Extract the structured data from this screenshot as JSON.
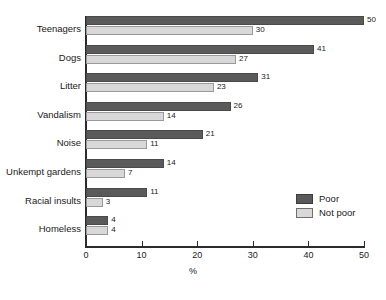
{
  "chart_data": {
    "type": "bar",
    "orientation": "horizontal",
    "title": "",
    "xlabel": "%",
    "ylabel": "",
    "xlim": [
      0,
      50
    ],
    "xticks": [
      0,
      10,
      20,
      30,
      40,
      50
    ],
    "xticklabels": [
      "0",
      "10",
      "20",
      "30",
      "40",
      "50"
    ],
    "grid": false,
    "legend_position": "lower-right",
    "categories": [
      "Teenagers",
      "Dogs",
      "Litter",
      "Vandalism",
      "Noise",
      "Unkempt gardens",
      "Racial insults",
      "Homeless"
    ],
    "series": [
      {
        "name": "Poor",
        "color": "#5a5a5a",
        "values": [
          50,
          41,
          31,
          26,
          21,
          14,
          11,
          4
        ],
        "labels": [
          "50",
          "41",
          "31",
          "26",
          "21",
          "14",
          "11",
          "4"
        ]
      },
      {
        "name": "Not poor",
        "color": "#d8d8d8",
        "values": [
          30,
          27,
          23,
          14,
          11,
          7,
          3,
          4
        ],
        "labels": [
          "30",
          "27",
          "23",
          "14",
          "11",
          "7",
          "3",
          "4"
        ]
      }
    ]
  },
  "legend": {
    "items": [
      {
        "label": "Poor",
        "swatch": "poor-swatch"
      },
      {
        "label": "Not poor",
        "swatch": "not-poor-swatch"
      }
    ]
  },
  "axis": {
    "x_title": "%"
  }
}
